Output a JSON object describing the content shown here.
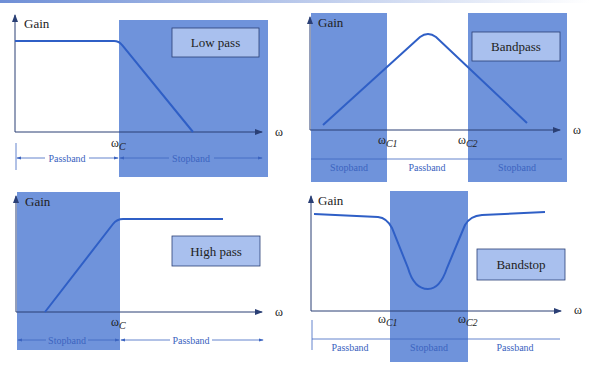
{
  "colors": {
    "band_fill": "#6f93db",
    "label_box_fill": "#a9c0ee",
    "curve": "#2f5fc6",
    "axis": "#2a3f75",
    "band_text": "#3c64c0",
    "text": "#222222"
  },
  "axes": {
    "ylabel": "Gain",
    "xlabel": "ω"
  },
  "panels": [
    {
      "id": "lowpass",
      "title": "Low pass",
      "cutoffs": [
        {
          "symbol": "ω",
          "sub": "C"
        }
      ],
      "bands": [
        "Passband",
        "Stopband"
      ]
    },
    {
      "id": "bandpass",
      "title": "Bandpass",
      "cutoffs": [
        {
          "symbol": "ω",
          "sub": "C1"
        },
        {
          "symbol": "ω",
          "sub": "C2"
        }
      ],
      "bands": [
        "Stopband",
        "Passband",
        "Stopband"
      ]
    },
    {
      "id": "highpass",
      "title": "High pass",
      "cutoffs": [
        {
          "symbol": "ω",
          "sub": "C"
        }
      ],
      "bands": [
        "Stopband",
        "Passband"
      ]
    },
    {
      "id": "bandstop",
      "title": "Bandstop",
      "cutoffs": [
        {
          "symbol": "ω",
          "sub": "C1"
        },
        {
          "symbol": "ω",
          "sub": "C2"
        }
      ],
      "bands": [
        "Passband",
        "Stopband",
        "Passband"
      ]
    }
  ]
}
